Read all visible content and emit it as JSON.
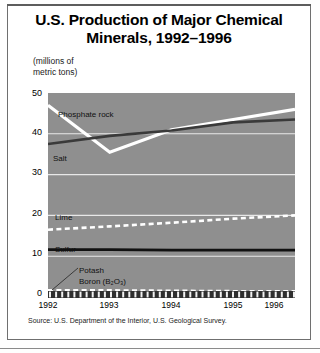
{
  "figure": {
    "title_line1": "U.S. Production of Major Chemical",
    "title_line2": "Minerals, 1992–1996",
    "unit_line1": "(millions of",
    "unit_line2": "metric tons)",
    "source": "Source: U.S. Department of the Interior, U.S. Geological Survey.",
    "colors": {
      "plot_background": "#8f8f8f",
      "gridline": "#e8e8e8",
      "white_series": "#ffffff",
      "dark_series": "#3a3a3a",
      "black_series": "#111111",
      "page_background": "#ffffff",
      "text": "#000000",
      "frame": "#6f6f6f"
    }
  },
  "labels": {
    "phosphate_rock": "Phosphate rock",
    "salt": "Salt",
    "lime": "Lime",
    "sulfur": "Sulfur",
    "potash": "Potash",
    "boron": "Boron (B₂O₃)"
  },
  "chart_data": {
    "type": "line",
    "title": "U.S. Production of Major Chemical Minerals, 1992–1996",
    "xlabel": "",
    "ylabel": "(millions of metric tons)",
    "x": [
      1992,
      1993,
      1994,
      1995,
      1996
    ],
    "xticklabels": [
      "1992",
      "1993",
      "1994",
      "1995",
      "1996"
    ],
    "yticklabels": [
      "0",
      "10",
      "20",
      "30",
      "40",
      "50"
    ],
    "yticks": [
      0,
      10,
      20,
      30,
      40,
      50
    ],
    "ylim": [
      0,
      50
    ],
    "xlim": [
      1992,
      1996
    ],
    "grid": true,
    "gridlines": [
      10,
      20,
      30,
      40
    ],
    "legend": "inline-labels",
    "series": [
      {
        "name": "Phosphate rock",
        "values": [
          47.0,
          35.5,
          41.0,
          43.5,
          46.0
        ],
        "style": "solid",
        "color": "#ffffff",
        "width": 3.2
      },
      {
        "name": "Salt",
        "values": [
          37.5,
          39.5,
          40.8,
          42.8,
          43.5
        ],
        "style": "solid",
        "color": "#3a3a3a",
        "width": 2.6
      },
      {
        "name": "Lime",
        "values": [
          16.5,
          17.3,
          18.2,
          19.2,
          20.0
        ],
        "style": "dashed",
        "color": "#ffffff",
        "width": 2.6
      },
      {
        "name": "Sulfur",
        "values": [
          11.6,
          11.6,
          11.5,
          11.5,
          11.5
        ],
        "style": "solid",
        "color": "#111111",
        "width": 2.8
      },
      {
        "name": "Potash",
        "values": [
          1.7,
          1.7,
          1.6,
          1.5,
          1.5
        ],
        "style": "dashed",
        "color": "#ffffff",
        "width": 2.0
      },
      {
        "name": "Boron (B₂O₃)",
        "values": [
          0.6,
          0.6,
          0.6,
          0.6,
          0.6
        ],
        "style": "dashed",
        "color": "#ffffff",
        "width": 2.0
      }
    ]
  }
}
